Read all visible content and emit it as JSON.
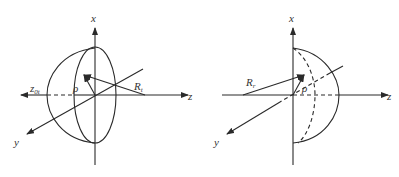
{
  "colors": {
    "stroke": "#2a2a2a",
    "background": "#ffffff"
  },
  "left_figure": {
    "description": "Hemisphere extending toward negative z (transmitting)",
    "labels": {
      "x_axis": "x",
      "z_axis": "z",
      "y_axis": "y",
      "offset": "z",
      "offset_sub": "0t",
      "rho": "ρ",
      "radius": "R",
      "radius_sub": "t"
    }
  },
  "right_figure": {
    "description": "Hemisphere extending toward positive z (receiving)",
    "labels": {
      "x_axis": "x",
      "z_axis": "z",
      "y_axis": "y",
      "rho": "ρ",
      "radius": "R",
      "radius_sub": "r"
    }
  }
}
